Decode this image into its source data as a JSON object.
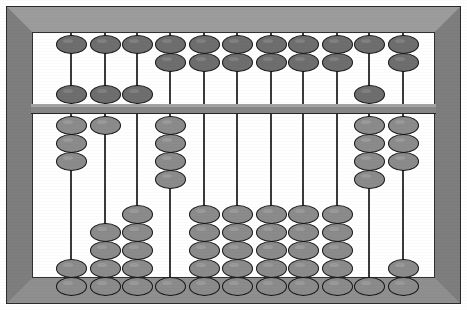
{
  "device": {
    "name": "Abacus",
    "type": "soroban-style bead frame",
    "rod_count": 11,
    "upper_beads_per_rod": 2,
    "lower_beads_per_rod": 5,
    "colors": {
      "frame": "#8a8a8a",
      "frame_top_bevel": "#9c9c9c",
      "frame_side_bevel": "#7e7e7e",
      "frame_outline": "#2b2b2b",
      "inner_background": "#ffffff",
      "crossbeam": "#878787",
      "rod": "#3a3a3a",
      "upper_bead": "#6e6e6e",
      "lower_bead": "#8b8b8b",
      "bead_outline": "#141414"
    }
  },
  "geometry": {
    "frame_left": 6,
    "frame_top": 6,
    "frame_width": 455,
    "frame_height": 298,
    "bevel": 26,
    "well_left": 32,
    "well_top": 32,
    "well_width": 403,
    "well_height": 246,
    "crossbeam_top": 104,
    "crossbeam_height": 10,
    "bead_width": 31,
    "bead_height": 19,
    "bead_pitch": 18,
    "upper_rest_top": 35,
    "upper_rest_bottom": 85,
    "lower_rest_top": 116,
    "lower_rest_bottom": 277,
    "rod_x": [
      71,
      105,
      137,
      170,
      204,
      237,
      271,
      303,
      337,
      369,
      403
    ],
    "rod_top": 33,
    "rod_bottom": 296
  },
  "rods": [
    {
      "index": 1,
      "label": "rod-1",
      "upper_raised": 1,
      "upper_lowered": 1,
      "lower_raised": 3,
      "lower_lowered": 2
    },
    {
      "index": 2,
      "label": "rod-2",
      "upper_raised": 1,
      "upper_lowered": 1,
      "lower_raised": 1,
      "lower_lowered": 4
    },
    {
      "index": 3,
      "label": "rod-3",
      "upper_raised": 1,
      "upper_lowered": 1,
      "lower_raised": 0,
      "lower_lowered": 5
    },
    {
      "index": 4,
      "label": "rod-4",
      "upper_raised": 2,
      "upper_lowered": 0,
      "lower_raised": 4,
      "lower_lowered": 1
    },
    {
      "index": 5,
      "label": "rod-5",
      "upper_raised": 2,
      "upper_lowered": 0,
      "lower_raised": 0,
      "lower_lowered": 5
    },
    {
      "index": 6,
      "label": "rod-6",
      "upper_raised": 2,
      "upper_lowered": 0,
      "lower_raised": 0,
      "lower_lowered": 5
    },
    {
      "index": 7,
      "label": "rod-7",
      "upper_raised": 2,
      "upper_lowered": 0,
      "lower_raised": 0,
      "lower_lowered": 5
    },
    {
      "index": 8,
      "label": "rod-8",
      "upper_raised": 2,
      "upper_lowered": 0,
      "lower_raised": 0,
      "lower_lowered": 5
    },
    {
      "index": 9,
      "label": "rod-9",
      "upper_raised": 2,
      "upper_lowered": 0,
      "lower_raised": 0,
      "lower_lowered": 5
    },
    {
      "index": 10,
      "label": "rod-10",
      "upper_raised": 1,
      "upper_lowered": 1,
      "lower_raised": 4,
      "lower_lowered": 1
    },
    {
      "index": 11,
      "label": "rod-11",
      "upper_raised": 2,
      "upper_lowered": 0,
      "lower_raised": 3,
      "lower_lowered": 2
    }
  ]
}
